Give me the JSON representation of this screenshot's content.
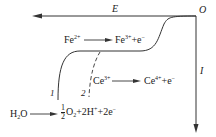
{
  "axes": {
    "x_label": "E",
    "y_label": "I",
    "origin_label": "O"
  },
  "curves": [
    {
      "id": "1",
      "label": "1",
      "style": "solid"
    },
    {
      "id": "2",
      "label": "2",
      "style": "dashed"
    }
  ],
  "reactions": {
    "fe": {
      "left": "Fe",
      "left_sup": "2+",
      "right": "Fe",
      "right_sup": "3+",
      "tail": "+e",
      "tail_sup": "−"
    },
    "ce": {
      "left": "Ce",
      "left_sup": "3+",
      "right": "Ce",
      "right_sup": "4+",
      "tail": "+e",
      "tail_sup": "−"
    },
    "water": {
      "left": "H",
      "left_sub": "2",
      "left_rest": "O",
      "frac_num": "1",
      "frac_den": "2",
      "o2": "O",
      "o2_sub": "2",
      "h": "+2H",
      "h_sup": "+",
      "e": "+2e",
      "e_sup": "−"
    }
  },
  "colors": {
    "line": "#333333",
    "background": "#ffffff"
  }
}
